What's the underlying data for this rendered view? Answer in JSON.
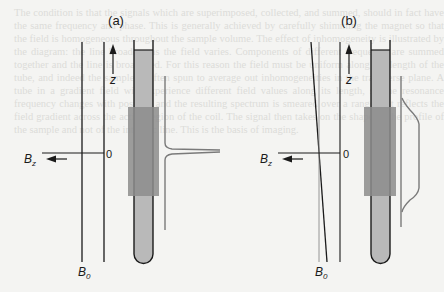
{
  "figure": {
    "panels": [
      {
        "id": "a",
        "label": "(a)",
        "description": "Homogeneous field B0: uniform along z, sharp single resonance line",
        "axis_label_z": "z",
        "axis_label_bz": "B",
        "axis_label_bz_sub": "z",
        "axis_label_b0": "B",
        "axis_label_b0_sub": "0",
        "zero_label": "0",
        "field_profile": "uniform",
        "spectrum_shape": "sharp-peak"
      },
      {
        "id": "b",
        "label": "(b)",
        "description": "Inhomogeneous field B0 varying linearly with z, broadened rectangular line",
        "axis_label_z": "z",
        "axis_label_bz": "B",
        "axis_label_bz_sub": "z",
        "axis_label_b0": "B",
        "axis_label_b0_sub": "0",
        "zero_label": "0",
        "field_profile": "linear-gradient",
        "spectrum_shape": "broad-flat"
      }
    ],
    "colors": {
      "line": "#1a1a1a",
      "tube_fill": "#b9b9b9",
      "coil_region": "#8c8c8c",
      "spectrum": "#7a7a7a",
      "background": "#f4f4f2"
    }
  },
  "background_text": "The condition is that the signals which are superimposed, collected, and summed, should in fact have the same frequency and phase. This is generally achieved by carefully shimming the magnet so that the field is homogeneous throughout the sample volume. The effect of inhomogeneity is illustrated by the diagram: the line broadens as the field varies. Components of different frequency are summed together and the line is broadened. For this reason the field must be uniform along the length of the tube, and indeed the sample is often spun to average out inhomogeneities in the transverse plane. A tube in a gradient field will experience different field values along its length, so the resonance frequency changes with position and the resulting spectrum is smeared over a range that reflects the field gradient across the active region of the coil. The signal then takes on the shape of the profile of the sample and not of the intrinsic line. This is the basis of imaging."
}
